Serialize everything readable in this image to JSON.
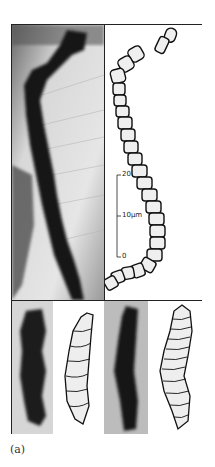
{
  "figure": {
    "label": "(a)",
    "scale_bar": {
      "ticks": [
        "20",
        "10µm",
        "0"
      ]
    },
    "panels": {
      "top": [
        "micrograph",
        "drawing"
      ],
      "bottom": [
        "micrograph",
        "drawing",
        "micrograph",
        "drawing"
      ]
    }
  }
}
